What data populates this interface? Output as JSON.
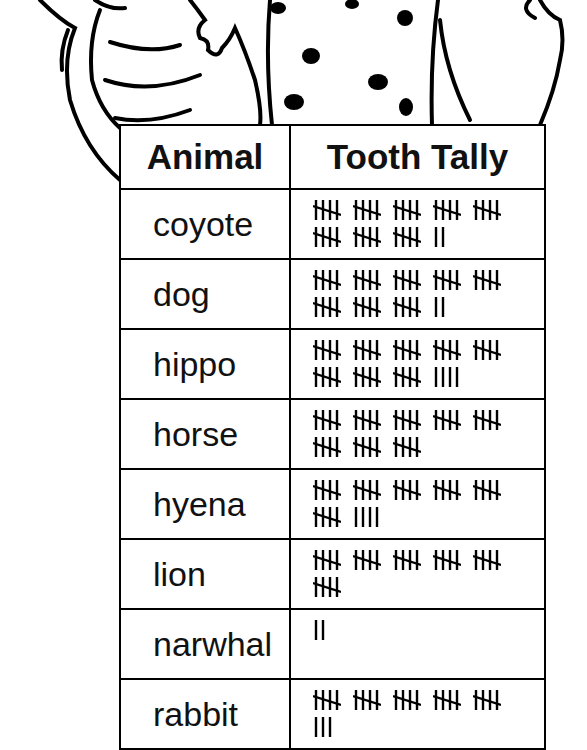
{
  "table": {
    "headers": [
      "Animal",
      "Tooth Tally"
    ],
    "rows": [
      {
        "animal": "coyote",
        "count": 42
      },
      {
        "animal": "dog",
        "count": 42
      },
      {
        "animal": "hippo",
        "count": 44
      },
      {
        "animal": "horse",
        "count": 40
      },
      {
        "animal": "hyena",
        "count": 34
      },
      {
        "animal": "lion",
        "count": 30
      },
      {
        "animal": "narwhal",
        "count": 2
      },
      {
        "animal": "rabbit",
        "count": 28
      }
    ]
  },
  "illustration": {
    "description": "cartoon animals (crocodile-like creature, spotted animal, another animal) standing behind the table",
    "line_color": "#000000",
    "fill_color": "#ffffff"
  }
}
